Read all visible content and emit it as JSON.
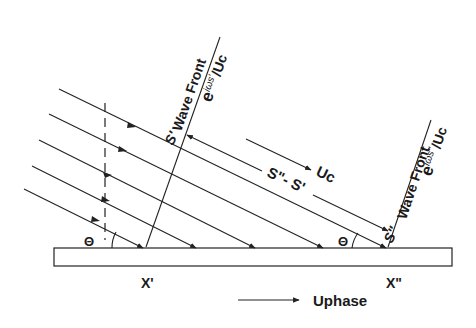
{
  "labels": {
    "wave_front_1": "Wave Front",
    "phase_1_e": "e",
    "phase_1_exp": "iωs'",
    "phase_1_den": "/Uc",
    "wave_front_2": "Wave Front",
    "phase_2_e": "e",
    "phase_2_exp": "iωs\"",
    "phase_2_den": "/Uc",
    "s_prime": "S'",
    "s_double_prime": "S\"",
    "path_difference": "S\"- S'",
    "uc": "Uc",
    "theta_left": "Θ",
    "theta_right": "Θ",
    "x_prime": "X'",
    "x_double_prime": "X\"",
    "uphase": "Uphase"
  },
  "colors": {
    "ink": "#222222",
    "background": "#ffffff"
  }
}
